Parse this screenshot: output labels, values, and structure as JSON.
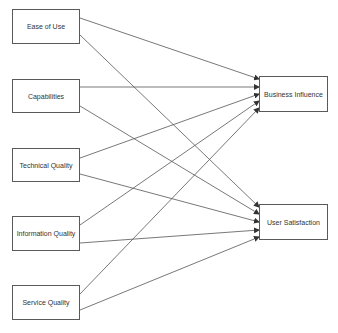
{
  "diagram": {
    "type": "path-model",
    "sources": [
      {
        "id": "ease",
        "label": "Ease of Use"
      },
      {
        "id": "cap",
        "label": "Capabilities"
      },
      {
        "id": "tech",
        "label": "Technical Quality"
      },
      {
        "id": "info",
        "label": "Information Quality"
      },
      {
        "id": "serv",
        "label": "Service Quality"
      }
    ],
    "targets": [
      {
        "id": "bi",
        "label": "Business Influence"
      },
      {
        "id": "us",
        "label": "User Satisfaction"
      }
    ],
    "edges": [
      {
        "from": "Ease of Use",
        "to": "Business Influence"
      },
      {
        "from": "Ease of Use",
        "to": "User Satisfaction"
      },
      {
        "from": "Capabilities",
        "to": "Business Influence"
      },
      {
        "from": "Capabilities",
        "to": "User Satisfaction"
      },
      {
        "from": "Technical Quality",
        "to": "Business Influence"
      },
      {
        "from": "Technical Quality",
        "to": "User Satisfaction"
      },
      {
        "from": "Information Quality",
        "to": "Business Influence"
      },
      {
        "from": "Information Quality",
        "to": "User Satisfaction"
      },
      {
        "from": "Service Quality",
        "to": "Business Influence"
      },
      {
        "from": "Service Quality",
        "to": "User Satisfaction"
      }
    ],
    "colors": {
      "line": "#555555",
      "border": "#5a5a5a",
      "text": "#333333"
    }
  }
}
